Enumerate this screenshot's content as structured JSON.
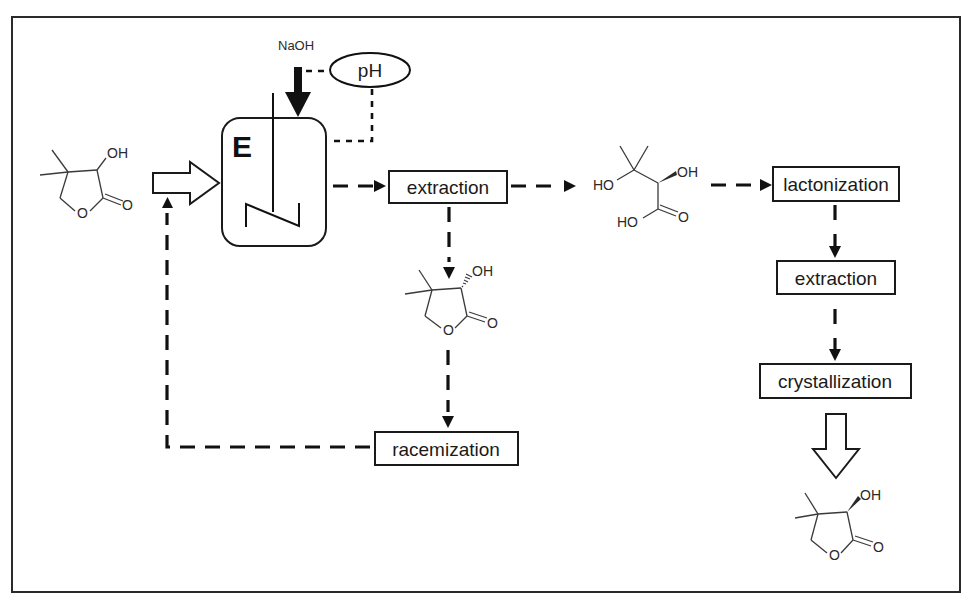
{
  "diagram": {
    "type": "process-flow",
    "title": "",
    "reactor": {
      "label": "E",
      "feed_reagent": "NaOH",
      "sensor": "pH"
    },
    "nodes": [
      {
        "id": "extraction1",
        "label": "extraction"
      },
      {
        "id": "racemization",
        "label": "racemization"
      },
      {
        "id": "lactonization",
        "label": "lactonization"
      },
      {
        "id": "extraction2",
        "label": "extraction"
      },
      {
        "id": "crystallization",
        "label": "crystallization"
      }
    ],
    "molecules": {
      "racemic_lactone": {
        "name": "racemic pantolactone",
        "labels": [
          "OH",
          "O",
          "O"
        ]
      },
      "s_lactone": {
        "name": "(S)-pantolactone",
        "labels": [
          "OH",
          "O",
          "O"
        ]
      },
      "hydroxy_acid": {
        "name": "pantoic acid",
        "labels": [
          "HO",
          "OH",
          "HO",
          "O"
        ]
      },
      "r_lactone": {
        "name": "(R)-pantolactone",
        "labels": [
          "OH",
          "O",
          "O"
        ]
      }
    },
    "edges": [
      {
        "from": "racemic_lactone",
        "to": "reactor",
        "style": "hollow-arrow"
      },
      {
        "from": "NaOH",
        "to": "reactor",
        "style": "solid-arrow"
      },
      {
        "from": "pH",
        "to": "NaOH",
        "style": "dotted"
      },
      {
        "from": "pH",
        "to": "reactor",
        "style": "dotted"
      },
      {
        "from": "reactor",
        "to": "extraction1",
        "style": "dashed-arrow"
      },
      {
        "from": "extraction1",
        "to": "hydroxy_acid",
        "style": "dashed-arrow"
      },
      {
        "from": "extraction1",
        "to": "s_lactone",
        "style": "dashed-arrow"
      },
      {
        "from": "s_lactone",
        "to": "racemization",
        "style": "dashed-arrow"
      },
      {
        "from": "racemization",
        "to": "reactor",
        "style": "dashed-arrow"
      },
      {
        "from": "hydroxy_acid",
        "to": "lactonization",
        "style": "dashed-arrow"
      },
      {
        "from": "lactonization",
        "to": "extraction2",
        "style": "dashed-arrow"
      },
      {
        "from": "extraction2",
        "to": "crystallization",
        "style": "dashed-arrow"
      },
      {
        "from": "crystallization",
        "to": "r_lactone",
        "style": "hollow-arrow"
      }
    ]
  }
}
